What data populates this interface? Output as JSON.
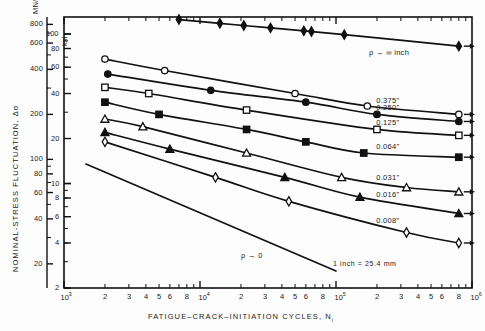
{
  "figure": {
    "background": "#fdfdfd",
    "ink": "#111111"
  },
  "axes": {
    "left_primary": {
      "label": "NOMINAL-STRESS FLUCTUATION, Δσ",
      "unit": "MN/m",
      "unit_exponent": "2",
      "ticks": [
        800,
        600,
        400,
        200,
        100,
        80,
        60,
        40,
        20
      ]
    },
    "left_secondary": {
      "unit": "ksi",
      "ticks": [
        100,
        80,
        60,
        40,
        20,
        10,
        8,
        6,
        4,
        2
      ]
    },
    "bottom": {
      "label": "FATIGUE–CRACK–INITIATION CYCLES, N",
      "label_subscript": "i",
      "decade_labels": [
        "10",
        "10",
        "10",
        "10"
      ],
      "decade_exponents": [
        "3",
        "4",
        "5",
        "6"
      ],
      "minor_labels": [
        "2",
        "3",
        "4",
        "5",
        "6",
        "8"
      ],
      "range": [
        1000,
        1000000
      ]
    }
  },
  "annotations": {
    "top_right": "ρ → ∞ inch",
    "bottom_left": "ρ → 0",
    "unit_note": "1 inch = 25.4 mm"
  },
  "chart_data": {
    "type": "line",
    "title": "",
    "xlabel": "FATIGUE-CRACK-INITIATION CYCLES, Ni",
    "ylabel": "NOMINAL-STRESS FLUCTUATION, Δσ",
    "xlabel_unit": "cycles",
    "ylabel_unit_primary": "MN/m2",
    "ylabel_unit_secondary": "ksi",
    "xscale": "log",
    "yscale": "log",
    "xlim": [
      1000,
      1000000
    ],
    "ylim_ksi": [
      2,
      130
    ],
    "ylim_mn": [
      13.8,
      897
    ],
    "grid": false,
    "legend": "inline-right-labels",
    "series": [
      {
        "name": "ρ → ∞ inch",
        "label": "ρ → ∞ inch",
        "marker": "filled-diamond",
        "runout_arrow": true,
        "points": [
          {
            "x": 7000,
            "y": 125
          },
          {
            "x": 14000,
            "y": 118
          },
          {
            "x": 21000,
            "y": 114
          },
          {
            "x": 33000,
            "y": 110
          },
          {
            "x": 58000,
            "y": 105
          },
          {
            "x": 66000,
            "y": 104
          },
          {
            "x": 115000,
            "y": 99
          },
          {
            "x": 800000,
            "y": 83
          }
        ]
      },
      {
        "name": "0.375 in",
        "label": "0.375\"",
        "marker": "open-circle",
        "runout_arrow": true,
        "points": [
          {
            "x": 2000,
            "y": 68
          },
          {
            "x": 5500,
            "y": 57
          },
          {
            "x": 50000,
            "y": 40
          },
          {
            "x": 170000,
            "y": 33
          },
          {
            "x": 800000,
            "y": 29
          }
        ]
      },
      {
        "name": "0.250 in",
        "label": "0.250\"",
        "marker": "filled-circle",
        "runout_arrow": true,
        "points": [
          {
            "x": 2100,
            "y": 54
          },
          {
            "x": 12000,
            "y": 42
          },
          {
            "x": 60000,
            "y": 35
          },
          {
            "x": 200000,
            "y": 29
          },
          {
            "x": 800000,
            "y": 26
          }
        ]
      },
      {
        "name": "0.125 in",
        "label": "0.125\"",
        "marker": "open-square",
        "runout_arrow": true,
        "points": [
          {
            "x": 2000,
            "y": 44
          },
          {
            "x": 4200,
            "y": 40
          },
          {
            "x": 22000,
            "y": 31
          },
          {
            "x": 200000,
            "y": 23
          },
          {
            "x": 800000,
            "y": 21
          }
        ]
      },
      {
        "name": "0.064 in",
        "label": "0.064\"",
        "marker": "filled-square",
        "runout_arrow": true,
        "points": [
          {
            "x": 2000,
            "y": 35
          },
          {
            "x": 5000,
            "y": 29
          },
          {
            "x": 22000,
            "y": 23
          },
          {
            "x": 60000,
            "y": 19
          },
          {
            "x": 160000,
            "y": 16
          },
          {
            "x": 800000,
            "y": 15
          }
        ]
      },
      {
        "name": "0.031 in",
        "label": "0.031\"",
        "marker": "open-triangle",
        "runout_arrow": true,
        "points": [
          {
            "x": 2000,
            "y": 27
          },
          {
            "x": 3800,
            "y": 24
          },
          {
            "x": 22000,
            "y": 16
          },
          {
            "x": 110000,
            "y": 11
          },
          {
            "x": 330000,
            "y": 9.4
          },
          {
            "x": 800000,
            "y": 8.8
          }
        ]
      },
      {
        "name": "0.016 in",
        "label": "0.016\"",
        "marker": "filled-triangle",
        "runout_arrow": true,
        "points": [
          {
            "x": 2000,
            "y": 22
          },
          {
            "x": 6000,
            "y": 17
          },
          {
            "x": 42000,
            "y": 11
          },
          {
            "x": 150000,
            "y": 8.1
          },
          {
            "x": 800000,
            "y": 6.3
          }
        ]
      },
      {
        "name": "0.008 in",
        "label": "0.008\"",
        "marker": "open-diamond",
        "runout_arrow": true,
        "points": [
          {
            "x": 2000,
            "y": 19
          },
          {
            "x": 13000,
            "y": 11
          },
          {
            "x": 45000,
            "y": 7.6
          },
          {
            "x": 330000,
            "y": 4.7
          },
          {
            "x": 800000,
            "y": 4.0
          }
        ]
      },
      {
        "name": "ρ → 0",
        "label": "ρ → 0",
        "marker": "none",
        "runout_arrow": false,
        "points": [
          {
            "x": 1450,
            "y": 13.5
          },
          {
            "x": 100000,
            "y": 2.6
          }
        ]
      }
    ]
  }
}
